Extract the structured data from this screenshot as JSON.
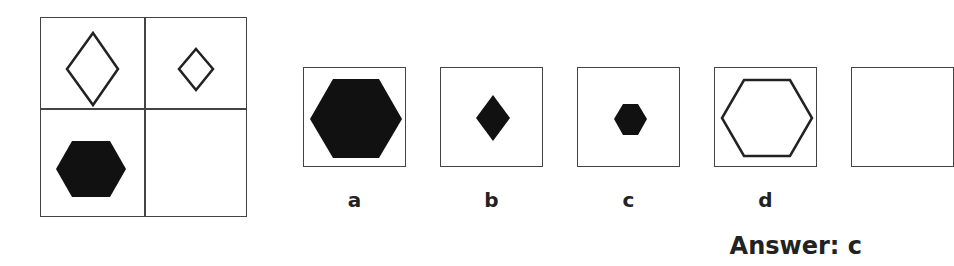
{
  "puzzle": {
    "matrix": {
      "cells": [
        {
          "position": "top-left",
          "shape": "diamond",
          "fill": "outline",
          "size": "large"
        },
        {
          "position": "top-right",
          "shape": "diamond",
          "fill": "outline",
          "size": "small"
        },
        {
          "position": "bottom-left",
          "shape": "hexagon",
          "fill": "solid",
          "size": "large"
        },
        {
          "position": "bottom-right",
          "shape": "empty",
          "fill": "none",
          "size": "none"
        }
      ]
    },
    "options": [
      {
        "label": "a",
        "shape": "hexagon",
        "fill": "solid",
        "size": "very large"
      },
      {
        "label": "b",
        "shape": "diamond",
        "fill": "solid",
        "size": "small"
      },
      {
        "label": "c",
        "shape": "hexagon",
        "fill": "solid",
        "size": "small"
      },
      {
        "label": "d",
        "shape": "hexagon",
        "fill": "outline",
        "size": "large"
      },
      {
        "label": "",
        "shape": "unknown",
        "fill": "unknown",
        "size": "cropped"
      }
    ],
    "answer_text": "Answer: c"
  },
  "colors": {
    "shape": "#111111",
    "border": "#444444",
    "background": "#ffffff"
  }
}
